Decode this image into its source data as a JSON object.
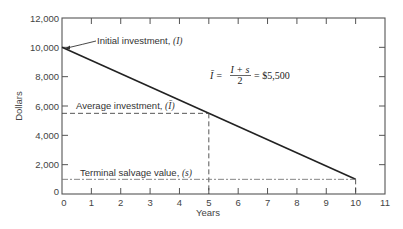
{
  "chart_data": {
    "type": "line",
    "title": "",
    "xlabel": "Years",
    "ylabel": "Dollars",
    "xlim": [
      0,
      11
    ],
    "ylim": [
      0,
      12000
    ],
    "x_ticks": [
      0,
      1,
      2,
      3,
      4,
      5,
      6,
      7,
      8,
      9,
      10,
      11
    ],
    "y_ticks": [
      0,
      2000,
      4000,
      6000,
      8000,
      10000,
      12000
    ],
    "y_tick_labels": [
      "0",
      "2,000",
      "4,000",
      "6,000",
      "8,000",
      "10,000",
      "12,000"
    ],
    "grid": false,
    "series": [
      {
        "name": "Investment value (straight-line depreciation)",
        "style": "solid",
        "x": [
          0,
          10
        ],
        "y": [
          10000,
          1000
        ]
      },
      {
        "name": "Average investment",
        "style": "dashed",
        "x": [
          0,
          5
        ],
        "y": [
          5500,
          5500
        ]
      },
      {
        "name": "Average investment drop line",
        "style": "dashed",
        "x": [
          5,
          5
        ],
        "y": [
          5500,
          0
        ]
      },
      {
        "name": "Terminal salvage value",
        "style": "dash-dot",
        "x": [
          0,
          10
        ],
        "y": [
          1000,
          1000
        ]
      },
      {
        "name": "Terminal drop line",
        "style": "dashed",
        "x": [
          10,
          10
        ],
        "y": [
          1000,
          0
        ]
      }
    ],
    "annotations": [
      {
        "text": "Initial investment, (I)",
        "x": 0,
        "y": 10000
      },
      {
        "text": "Average investment, (Ī)",
        "x": 0.3,
        "y": 5500
      },
      {
        "text": "Terminal salvage value, (s)",
        "x": 0.6,
        "y": 1000
      },
      {
        "text": "Ī = (I + s) / 2 = $5,500",
        "x": 5.3,
        "y": 8200
      }
    ]
  },
  "labels": {
    "ylabel": "Dollars",
    "xlabel": "Years",
    "initial": "Initial investment, ",
    "initial_sym": "(I)",
    "average": "Average investment, ",
    "average_sym": "(Ī)",
    "terminal": "Terminal salvage value, ",
    "terminal_sym": "(s)",
    "formula_lhs": "Ī =",
    "formula_num": "I + s",
    "formula_den": "2",
    "formula_rhs": "= $5,500"
  }
}
